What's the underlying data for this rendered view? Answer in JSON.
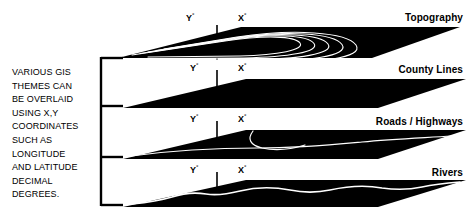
{
  "diagram": {
    "title_text": "VARIOUS GIS THEMES CAN BE OVERLAID USING X,Y COORDINATES SUCH AS LONGITUDE AND LATITUDE DECIMAL DEGREES.",
    "description_lines": "VARIOUS GIS\nTHEMES CAN\nBE OVERLAID\nUSING X,Y\nCOORDINATES\nSUCH AS\nLONGITUDE\nAND LATITUDE\nDECIMAL\nDEGREES.",
    "colors": {
      "slab_fill": "#000000",
      "feature_line": "#ffffff",
      "background": "#ffffff",
      "text": "#000000",
      "bracket": "#000000"
    },
    "axis": {
      "y_label": "Y",
      "x_label": "X",
      "degree_symbol": "°"
    },
    "layers": [
      {
        "id": "topography",
        "name": "Topography",
        "y_label": "Y",
        "x_label": "X",
        "feature_type": "contour-lines",
        "feature_count": 5
      },
      {
        "id": "county-lines",
        "name": "County Lines",
        "y_label": "Y",
        "x_label": "X",
        "feature_type": "none",
        "feature_count": 0
      },
      {
        "id": "roads-highways",
        "name": "Roads / Highways",
        "y_label": "Y",
        "x_label": "X",
        "feature_type": "road-curves",
        "feature_count": 2
      },
      {
        "id": "rivers",
        "name": "Rivers",
        "y_label": "Y",
        "x_label": "X",
        "feature_type": "river-wave",
        "feature_count": 1
      }
    ],
    "bracket": {
      "tick_count": 4
    }
  }
}
